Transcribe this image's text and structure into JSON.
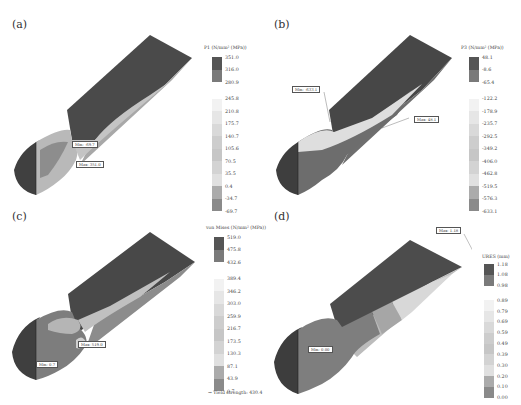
{
  "figure": {
    "panels": [
      {
        "label": "(a)",
        "legend_title": "P1 (N/mm² (MPa))",
        "ticks": [
          "351.0",
          "316.0",
          "280.9",
          "245.8",
          "210.8",
          "175.7",
          "140.7",
          "105.6",
          "70.5",
          "35.5",
          "0.4",
          "-34.7",
          "-69.7"
        ],
        "segment_colors": [
          "#5a5a5a",
          "#7c7c7c",
          "#ffffff",
          "#e9e9e9",
          "#dcdcdc",
          "#d0d0d0",
          "#c9c9c9",
          "#d6d6d6",
          "#e2e2e2",
          "#ececec",
          "#b0b0b0",
          "#8a8a8a",
          "#6c6c6c"
        ],
        "tags": [
          {
            "text": "Min: -69.7"
          },
          {
            "text": "Max: 351.0"
          }
        ]
      },
      {
        "label": "(b)",
        "legend_title": "P3 (N/mm² (MPa))",
        "ticks": [
          "48.1",
          "-8.6",
          "-65.4",
          "-122.2",
          "-178.9",
          "-235.7",
          "-292.5",
          "-349.2",
          "-406.0",
          "-462.8",
          "-519.5",
          "-576.3",
          "-633.1"
        ],
        "segment_colors": [
          "#5a5a5a",
          "#7c7c7c",
          "#ffffff",
          "#ebebeb",
          "#dedede",
          "#d3d3d3",
          "#cacaca",
          "#d8d8d8",
          "#e4e4e4",
          "#ececec",
          "#b0b0b0",
          "#8a8a8a",
          "#6c6c6c"
        ],
        "tags": [
          {
            "text": "Min: -633.1"
          },
          {
            "text": "Max: 48.1"
          }
        ]
      },
      {
        "label": "(c)",
        "legend_title": "von Mises (N/mm² (MPa))",
        "ticks": [
          "519.0",
          "475.8",
          "432.6",
          "389.4",
          "346.2",
          "303.0",
          "259.9",
          "216.7",
          "173.5",
          "130.3",
          "87.1",
          "43.9",
          "0.7"
        ],
        "segment_colors": [
          "#5a5a5a",
          "#7c7c7c",
          "#ffffff",
          "#ebebeb",
          "#dedede",
          "#d3d3d3",
          "#cacaca",
          "#d8d8d8",
          "#e4e4e4",
          "#ececec",
          "#b0b0b0",
          "#8a8a8a",
          "#6c6c6c"
        ],
        "tags": [
          {
            "text": "Max: 519.0"
          },
          {
            "text": "Min: 0.7"
          }
        ],
        "yield_label": "→ Yield strength: 430.4"
      },
      {
        "label": "(d)",
        "legend_title": "URES (mm)",
        "ticks": [
          "1.18",
          "1.08",
          "0.98",
          "0.89",
          "0.79",
          "0.69",
          "0.59",
          "0.49",
          "0.39",
          "0.30",
          "0.20",
          "0.10",
          "0.00"
        ],
        "segment_colors": [
          "#5a5a5a",
          "#7c7c7c",
          "#ffffff",
          "#ebebeb",
          "#dedede",
          "#d3d3d3",
          "#cacaca",
          "#d8d8d8",
          "#e4e4e4",
          "#ececec",
          "#b0b0b0",
          "#8a8a8a",
          "#6c6c6c"
        ],
        "tags": [
          {
            "text": "Max: 1.18"
          },
          {
            "text": "Min: 0.00"
          }
        ]
      }
    ]
  }
}
